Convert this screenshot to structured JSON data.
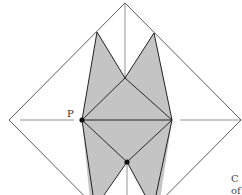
{
  "diagram": {
    "type": "origami crease pattern",
    "point_labels": {
      "p": "P"
    },
    "cut_text": {
      "line1": "C",
      "line2": "of"
    },
    "colors": {
      "fill": "#c4c4c4",
      "stroke": "#222222",
      "thin_line": "#555555",
      "dot": "#111111"
    }
  }
}
